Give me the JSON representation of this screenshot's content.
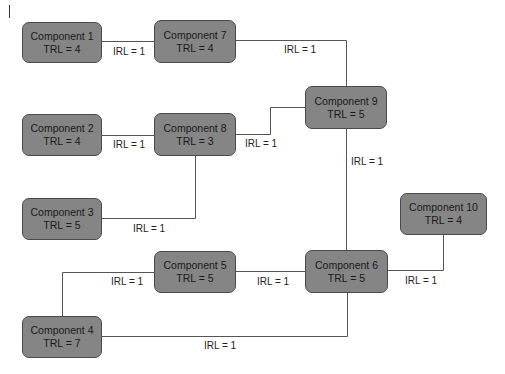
{
  "diagram": {
    "type": "component-integration-network",
    "colors": {
      "node_fill": "#858585",
      "node_border": "#4a4a4a",
      "line": "#555555",
      "text": "#1a1a1a"
    },
    "nodes": [
      {
        "id": "c1",
        "name": "Component 1",
        "trl": "TRL = 4"
      },
      {
        "id": "c2",
        "name": "Component 2",
        "trl": "TRL = 4"
      },
      {
        "id": "c3",
        "name": "Component 3",
        "trl": "TRL = 5"
      },
      {
        "id": "c4",
        "name": "Component 4",
        "trl": "TRL = 7"
      },
      {
        "id": "c5",
        "name": "Component 5",
        "trl": "TRL = 5"
      },
      {
        "id": "c6",
        "name": "Component 6",
        "trl": "TRL = 5"
      },
      {
        "id": "c7",
        "name": "Component 7",
        "trl": "TRL = 4"
      },
      {
        "id": "c8",
        "name": "Component 8",
        "trl": "TRL = 3"
      },
      {
        "id": "c9",
        "name": "Component 9",
        "trl": "TRL = 5"
      },
      {
        "id": "c10",
        "name": "Component 10",
        "trl": "TRL = 4"
      }
    ],
    "edges": [
      {
        "from": "Component 1",
        "to": "Component 7",
        "label": "IRL = 1"
      },
      {
        "from": "Component 7",
        "to": "Component 9",
        "label": "IRL = 1"
      },
      {
        "from": "Component 2",
        "to": "Component 8",
        "label": "IRL = 1"
      },
      {
        "from": "Component 8",
        "to": "Component 9",
        "label": "IRL = 1"
      },
      {
        "from": "Component 3",
        "to": "Component 8",
        "label": "IRL = 1"
      },
      {
        "from": "Component 9",
        "to": "Component 6",
        "label": "IRL = 1"
      },
      {
        "from": "Component 5",
        "to": "Component 4",
        "label": "IRL = 1"
      },
      {
        "from": "Component 5",
        "to": "Component 6",
        "label": "IRL = 1"
      },
      {
        "from": "Component 6",
        "to": "Component 10",
        "label": "IRL = 1"
      },
      {
        "from": "Component 4",
        "to": "Component 6",
        "label": "IRL = 1"
      }
    ]
  }
}
